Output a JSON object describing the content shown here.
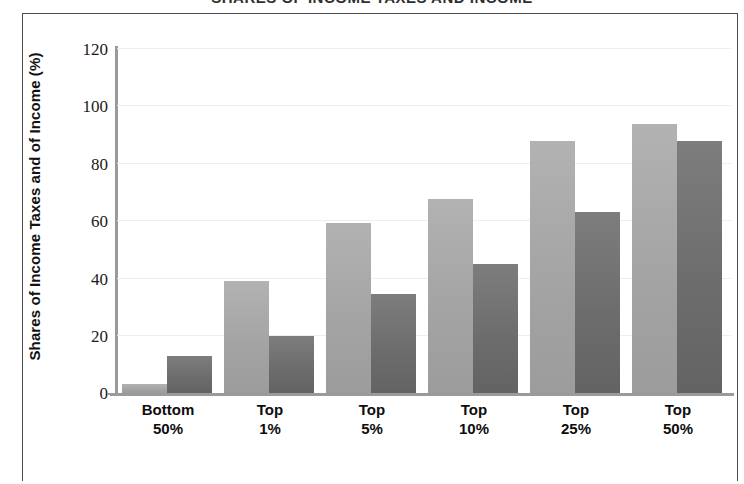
{
  "title_partial": "SHARES OF INCOME TAXES AND INCOME",
  "axis": {
    "ylabel": "Shares of Income Taxes and of Income (%)",
    "yticks": [
      "120",
      "100",
      "80",
      "60",
      "40",
      "20",
      "0"
    ]
  },
  "colors": {
    "series_income_taxes": "#a8a8a8",
    "series_income": "#6e6e6e",
    "axis": "#9a9a9a",
    "grid": "#eeeeee",
    "frame": "#4a4a4a"
  },
  "categories": [
    {
      "line1": "Bottom",
      "line2": "50%"
    },
    {
      "line1": "Top",
      "line2": "1%"
    },
    {
      "line1": "Top",
      "line2": "5%"
    },
    {
      "line1": "Top",
      "line2": "10%"
    },
    {
      "line1": "Top",
      "line2": "25%"
    },
    {
      "line1": "Top",
      "line2": "50%"
    }
  ],
  "chart_data": {
    "type": "bar",
    "title": "SHARES OF INCOME TAXES AND INCOME",
    "xlabel": "",
    "ylabel": "Shares of Income Taxes and of Income (%)",
    "ylim": [
      0,
      120
    ],
    "yticks": [
      0,
      20,
      40,
      60,
      80,
      100,
      120
    ],
    "grid": true,
    "legend": "none",
    "categories": [
      "Bottom 50%",
      "Top 1%",
      "Top 5%",
      "Top 10%",
      "Top 25%",
      "Top 50%"
    ],
    "series": [
      {
        "name": "Share of Income Taxes",
        "color": "#a8a8a8",
        "values": [
          3,
          39,
          59,
          67.5,
          87.5,
          93.5
        ]
      },
      {
        "name": "Share of Income",
        "color": "#6e6e6e",
        "values": [
          13,
          20,
          34.5,
          45,
          63,
          87.5
        ]
      }
    ]
  }
}
